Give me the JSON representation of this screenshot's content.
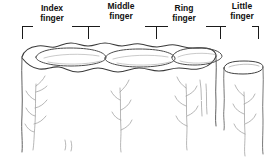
{
  "figure": {
    "background_color": "#ffffff",
    "ink_color": "#2b2b2b",
    "label_color": "#111111",
    "faint_ink_color": "#9a9a9a"
  },
  "labels": [
    {
      "id": "index",
      "line1": "Index",
      "line2": "finger"
    },
    {
      "id": "middle",
      "line1": "Middle",
      "line2": "finger"
    },
    {
      "id": "ring",
      "line1": "Ring",
      "line2": "finger"
    },
    {
      "id": "little",
      "line1": "Little",
      "line2": "finger"
    }
  ],
  "scale_bar": {
    "baseline_y": 26,
    "tick_positions": [
      22,
      88,
      156,
      220,
      258
    ],
    "tick_height": 12,
    "segments": [
      {
        "label": "Index finger",
        "from": 22,
        "to": 88
      },
      {
        "label": "Middle finger",
        "from": 88,
        "to": 156
      },
      {
        "label": "Ring finger",
        "from": 156,
        "to": 220
      },
      {
        "label": "Little finger",
        "from": 220,
        "to": 258
      }
    ]
  },
  "drawing": {
    "description": "Pencil sketch of four adjacent column-like ridges seen from above; three joined ellipses at left and a separate smaller ellipse at right, with faint sprig marks below.",
    "ellipses": [
      {
        "name": "index-pad",
        "cx": 72,
        "cy": 58,
        "rx": 38,
        "ry": 9
      },
      {
        "name": "middle-pad",
        "cx": 139,
        "cy": 59,
        "rx": 38,
        "ry": 9
      },
      {
        "name": "ring-pad",
        "cx": 196,
        "cy": 58,
        "rx": 31,
        "ry": 8
      },
      {
        "name": "little-pad",
        "cx": 244,
        "cy": 68,
        "rx": 21,
        "ry": 5
      }
    ],
    "body_left_edge_x": 22,
    "body_right_edge_x": 216,
    "little_left_edge_x": 224,
    "little_right_edge_x": 263,
    "body_bottom_y": 152
  }
}
